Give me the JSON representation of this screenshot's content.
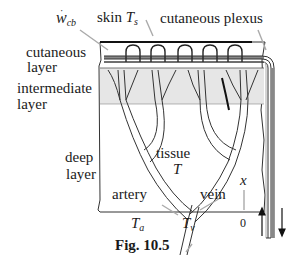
{
  "labels": {
    "w_cb_main": "w",
    "w_cb_sub": "cb",
    "skin": "skin",
    "T_s_main": "T",
    "T_s_sub": "s",
    "cutaneous_plexus": "cutaneous  plexus",
    "cutaneous": "cutaneous",
    "layer1": "layer",
    "intermediate": "intermediate",
    "layer2": "layer",
    "deep": "deep",
    "layer3": "layer",
    "tissue": "tissue",
    "T": "T",
    "artery": "artery",
    "vein": "vein",
    "x": "x",
    "zero": "0",
    "T_a_main": "T",
    "T_a_sub": "a",
    "T_v_main": "T",
    "T_v_sub": "v"
  },
  "caption": "Fig. 10.5",
  "colors": {
    "line": "#333333",
    "intermediate_fill": "#e6e6e6",
    "plexus_bar": "#888888",
    "pointer": "#aaaaaa"
  }
}
